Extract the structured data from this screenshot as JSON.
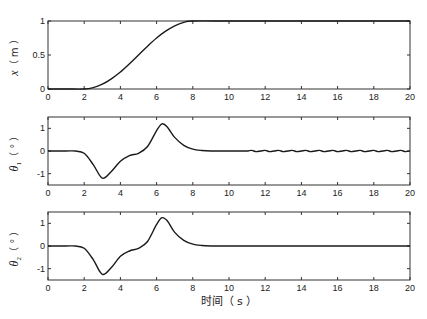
{
  "chart_data": [
    {
      "type": "line",
      "title": "",
      "xlabel": "",
      "ylabel": "x（m）",
      "xlim": [
        0,
        20
      ],
      "ylim": [
        0,
        1
      ],
      "xticks": [
        0,
        2,
        4,
        6,
        8,
        10,
        12,
        14,
        16,
        18,
        20
      ],
      "yticks": [
        0,
        0.5,
        1
      ],
      "ytick_labels": [
        "0",
        "0.5",
        "1"
      ],
      "grid": false,
      "series": [
        {
          "name": "x",
          "x": [
            0,
            1,
            2,
            2.5,
            3,
            3.5,
            4,
            4.5,
            5,
            5.5,
            6,
            6.5,
            7,
            7.5,
            8,
            10,
            12,
            14,
            16,
            18,
            20
          ],
          "y": [
            0,
            0,
            0,
            0.02,
            0.07,
            0.15,
            0.25,
            0.37,
            0.5,
            0.63,
            0.75,
            0.85,
            0.93,
            0.98,
            1.0,
            1.0,
            1.0,
            1.0,
            1.0,
            1.0,
            1.0
          ]
        }
      ]
    },
    {
      "type": "line",
      "title": "",
      "xlabel": "",
      "ylabel": "θ1（°）",
      "xlim": [
        0,
        20
      ],
      "ylim": [
        -1.5,
        1.5
      ],
      "xticks": [
        0,
        2,
        4,
        6,
        8,
        10,
        12,
        14,
        16,
        18,
        20
      ],
      "yticks": [
        -1,
        0,
        1
      ],
      "ytick_labels": [
        "-1",
        "0",
        "1"
      ],
      "grid": false,
      "series": [
        {
          "name": "theta1",
          "x": [
            0,
            1,
            1.5,
            2,
            2.5,
            3,
            3.5,
            4,
            4.5,
            5,
            5.5,
            6,
            6.3,
            6.6,
            7,
            7.5,
            8,
            8.5,
            9,
            10,
            11,
            12,
            14,
            16,
            18,
            20
          ],
          "y": [
            0,
            0,
            0,
            -0.1,
            -0.6,
            -1.2,
            -0.9,
            -0.45,
            -0.2,
            -0.1,
            0.2,
            0.9,
            1.2,
            1.05,
            0.6,
            0.25,
            0.08,
            0.02,
            0,
            0,
            0,
            0.02,
            -0.02,
            0.02,
            -0.02,
            0
          ]
        }
      ],
      "annotations": [
        "small residual oscillation after ~11 s"
      ]
    },
    {
      "type": "line",
      "title": "",
      "xlabel": "时间（s）",
      "ylabel": "θ2（°）",
      "xlim": [
        0,
        20
      ],
      "ylim": [
        -1.5,
        1.5
      ],
      "xticks": [
        0,
        2,
        4,
        6,
        8,
        10,
        12,
        14,
        16,
        18,
        20
      ],
      "yticks": [
        -1,
        0,
        1
      ],
      "ytick_labels": [
        "-1",
        "0",
        "1"
      ],
      "grid": false,
      "series": [
        {
          "name": "theta2",
          "x": [
            0,
            1,
            1.5,
            2,
            2.5,
            3,
            3.5,
            4,
            4.5,
            5,
            5.5,
            6,
            6.3,
            6.6,
            7,
            7.5,
            8,
            8.5,
            9,
            10,
            12,
            14,
            16,
            18,
            20
          ],
          "y": [
            0,
            0,
            0,
            -0.1,
            -0.6,
            -1.25,
            -0.95,
            -0.45,
            -0.22,
            -0.1,
            0.2,
            0.95,
            1.25,
            1.1,
            0.6,
            0.25,
            0.08,
            0.02,
            0,
            0,
            0,
            0,
            0,
            0,
            0
          ]
        }
      ]
    }
  ],
  "labels": {
    "plot1_ylabel_var": "x",
    "plot1_ylabel_unit": "（ m ）",
    "plot2_ylabel_var": "θ",
    "plot2_ylabel_sub": "1",
    "plot2_ylabel_unit": "（ ° ）",
    "plot3_ylabel_var": "θ",
    "plot3_ylabel_sub": "2",
    "plot3_ylabel_unit": "（ ° ）",
    "xlabel": "时间（ s ）"
  }
}
